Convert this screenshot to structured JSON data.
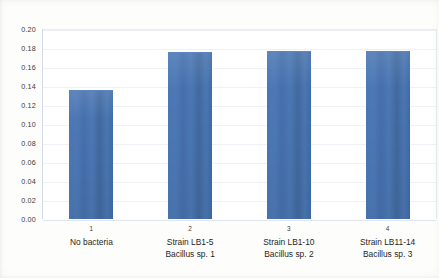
{
  "chart_data": {
    "type": "bar",
    "title": "",
    "subtitle": "",
    "xlabel": "",
    "ylabel": "",
    "ylim": [
      0.0,
      0.2
    ],
    "ystep": 0.02,
    "grid": true,
    "legend": "none",
    "bar_color": "#4472a8",
    "categories": [
      "No bacteria",
      "Strain LB1-5 Bacillus sp. 1",
      "Strain LB1-10 Bacillus sp. 2",
      "Strain LB11-14 Bacillus sp. 3"
    ],
    "category_lines": [
      [
        "No bacteria",
        ""
      ],
      [
        "Strain LB1-5",
        "Bacillus sp. 1"
      ],
      [
        "Strain LB1-10",
        "Bacillus sp. 2"
      ],
      [
        "Strain LB11-14",
        "Bacillus sp. 3"
      ]
    ],
    "tick_numbers": [
      "1",
      "2",
      "3",
      "4"
    ],
    "values": [
      0.135,
      0.175,
      0.176,
      0.176
    ],
    "ytick_labels": [
      "0.20",
      "0.18",
      "0.16",
      "0.14",
      "0.12",
      "0.10",
      "0.08",
      "0.06",
      "0.04",
      "0.02",
      "0.00"
    ],
    "ytick_values": [
      0.2,
      0.18,
      0.16,
      0.14,
      0.12,
      0.1,
      0.08,
      0.06,
      0.04,
      0.02,
      0.0
    ]
  }
}
